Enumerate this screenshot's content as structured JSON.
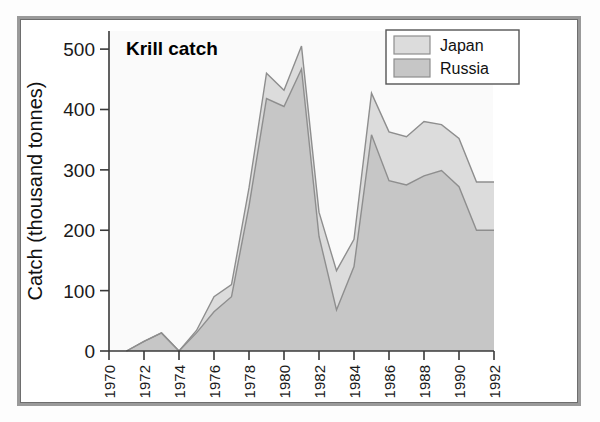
{
  "figure": {
    "title": "Krill catch",
    "border_color": "#9a9a9a",
    "plot_background": "#fafafa"
  },
  "legend": {
    "position": "top-right",
    "entries": [
      {
        "label": "Japan",
        "color": "#dcdcdc"
      },
      {
        "label": "Russia",
        "color": "#c6c6c6"
      }
    ]
  },
  "axes": {
    "ylabel": "Catch (thousand tonnes)",
    "xlabel": "",
    "yticks": [
      "0",
      "100",
      "200",
      "300",
      "400",
      "500"
    ],
    "xticks": [
      "1970",
      "1972",
      "1974",
      "1976",
      "1978",
      "1980",
      "1982",
      "1984",
      "1986",
      "1988",
      "1990",
      "1992"
    ]
  },
  "chart_data": {
    "type": "area",
    "stacked": true,
    "title": "Krill catch",
    "xlabel": "",
    "ylabel": "Catch (thousand tonnes)",
    "xlim": [
      1970,
      1992
    ],
    "ylim": [
      0,
      530
    ],
    "grid": false,
    "legend_position": "top-right",
    "x": [
      1971,
      1972,
      1973,
      1974,
      1975,
      1976,
      1977,
      1978,
      1979,
      1980,
      1981,
      1982,
      1983,
      1984,
      1985,
      1986,
      1987,
      1988,
      1989,
      1990,
      1991,
      1992
    ],
    "categories": [
      "1971",
      "1972",
      "1973",
      "1974",
      "1975",
      "1976",
      "1977",
      "1978",
      "1979",
      "1980",
      "1981",
      "1982",
      "1983",
      "1984",
      "1985",
      "1986",
      "1987",
      "1988",
      "1989",
      "1990",
      "1991",
      "1992"
    ],
    "series": [
      {
        "name": "Russia",
        "color": "#c6c6c6",
        "values": [
          0,
          16,
          30,
          0,
          30,
          65,
          90,
          240,
          418,
          405,
          467,
          190,
          68,
          140,
          358,
          282,
          275,
          290,
          299,
          272,
          200,
          200
        ]
      },
      {
        "name": "Japan",
        "color": "#dcdcdc",
        "values": [
          0,
          0,
          0,
          0,
          4,
          25,
          20,
          30,
          42,
          27,
          38,
          40,
          65,
          45,
          69,
          81,
          80,
          90,
          76,
          80,
          80,
          80
        ]
      }
    ],
    "totals": [
      0,
      16,
      30,
      0,
      34,
      90,
      110,
      270,
      460,
      432,
      505,
      230,
      133,
      185,
      427,
      363,
      355,
      380,
      375,
      352,
      280,
      280
    ]
  }
}
